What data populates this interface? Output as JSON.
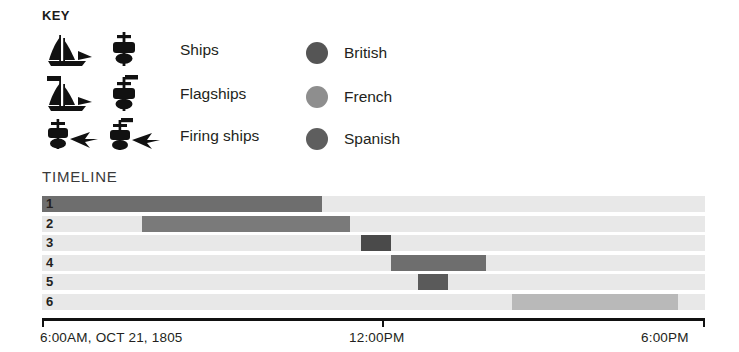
{
  "key": {
    "title": "KEY",
    "rows": [
      {
        "label": "Ships",
        "icon_side": "ship-side-icon",
        "icon_top": "ship-top-icon"
      },
      {
        "label": "Flagships",
        "icon_side": "flagship-side-icon",
        "icon_top": "flagship-top-icon"
      },
      {
        "label": "Firing ships",
        "icon_side": "firing-ship-side-icon",
        "icon_top": "firing-ship-top-icon"
      }
    ],
    "nations": [
      {
        "label": "British",
        "color": "#555555"
      },
      {
        "label": "French",
        "color": "#8e8e8e"
      },
      {
        "label": "Spanish",
        "color": "#5e5e5e"
      }
    ]
  },
  "timeline": {
    "title": "TIMELINE",
    "axis": {
      "start_label": "6:00AM, OCT 21, 1805",
      "mid_label": "12:00PM",
      "end_label": "6:00PM"
    }
  },
  "chart_data": {
    "type": "bar",
    "title": "TIMELINE",
    "xlabel": "",
    "ylabel": "",
    "orientation": "horizontal",
    "grid": false,
    "legend_position": "top-right",
    "x_axis": {
      "start": "6:00AM",
      "end": "6:00PM",
      "date": "OCT 21, 1805",
      "ticks": [
        "6:00AM, OCT 21, 1805",
        "12:00PM",
        "6:00PM"
      ],
      "tick_fractions": [
        0,
        0.512,
        1
      ]
    },
    "categories": [
      "1",
      "2",
      "3",
      "4",
      "5",
      "6"
    ],
    "series": [
      {
        "name": "Phase spans",
        "bars": [
          {
            "row": "1",
            "start_frac": 0.0,
            "end_frac": 0.422,
            "color": "#6e6e6e"
          },
          {
            "row": "2",
            "start_frac": 0.151,
            "end_frac": 0.465,
            "color": "#7a7a7a"
          },
          {
            "row": "3",
            "start_frac": 0.481,
            "end_frac": 0.526,
            "color": "#4a4a4a"
          },
          {
            "row": "4",
            "start_frac": 0.526,
            "end_frac": 0.67,
            "color": "#6e6e6e"
          },
          {
            "row": "5",
            "start_frac": 0.567,
            "end_frac": 0.612,
            "color": "#5a5a5a"
          },
          {
            "row": "6",
            "start_frac": 0.709,
            "end_frac": 0.96,
            "color": "#b9b9b9"
          }
        ]
      }
    ],
    "track_color": "#e8e8e8"
  }
}
